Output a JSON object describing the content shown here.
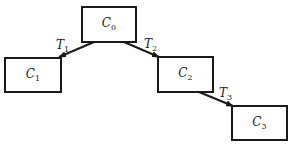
{
  "diagram": {
    "nodes": [
      {
        "id": "C0",
        "base": "C",
        "sub": "0",
        "x": 81,
        "y": 6,
        "w": 56,
        "h": 37
      },
      {
        "id": "C1",
        "base": "C",
        "sub": "1",
        "x": 4,
        "y": 57,
        "w": 58,
        "h": 36
      },
      {
        "id": "C2",
        "base": "C",
        "sub": "2",
        "x": 157,
        "y": 56,
        "w": 57,
        "h": 37
      },
      {
        "id": "C3",
        "base": "C",
        "sub": "3",
        "x": 231,
        "y": 105,
        "w": 57,
        "h": 36
      }
    ],
    "edges": [
      {
        "from": "C0",
        "to": "C1",
        "base": "T",
        "sub": "1",
        "x1": 94,
        "y1": 42,
        "x2": 59,
        "y2": 57,
        "lx": 56,
        "ly": 38
      },
      {
        "from": "C0",
        "to": "C2",
        "base": "T",
        "sub": "2",
        "x1": 124,
        "y1": 42,
        "x2": 159,
        "y2": 57,
        "lx": 144,
        "ly": 37
      },
      {
        "from": "C2",
        "to": "C3",
        "base": "T",
        "sub": "3",
        "x1": 199,
        "y1": 92,
        "x2": 233,
        "y2": 106,
        "lx": 219,
        "ly": 86
      }
    ],
    "line_color": "#1a1a1a"
  }
}
